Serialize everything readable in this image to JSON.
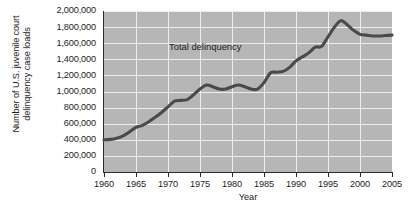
{
  "figure": {
    "background_color": "#ffffff",
    "plot_background_color": "#b6b6b6",
    "gridline_color": "#eeeeee",
    "axis_color": "#2a2a2a",
    "line_color": "#4a4a4a"
  },
  "chart_data": {
    "type": "line",
    "title": "",
    "subtitle": "",
    "xlabel": "Year",
    "ylabel": "Number of U.S. juvenile court delinquency case loads",
    "xlim": [
      1960,
      2005
    ],
    "ylim": [
      0,
      2000000
    ],
    "grid": true,
    "legend_position": "inline-annotation",
    "annotations": [
      {
        "text": "Total delinquency",
        "x": 1978,
        "y": 1520000
      }
    ],
    "xticks": [
      1960,
      1965,
      1970,
      1975,
      1980,
      1985,
      1990,
      1995,
      2000,
      2005
    ],
    "xtick_labels": [
      "1960",
      "1965",
      "1970",
      "1975",
      "1980",
      "1985",
      "1990",
      "1995",
      "2000",
      "2005"
    ],
    "yticks": [
      0,
      200000,
      400000,
      600000,
      800000,
      1000000,
      1200000,
      1400000,
      1600000,
      1800000,
      2000000
    ],
    "ytick_labels": [
      "0",
      "200,000",
      "400,000",
      "600,000",
      "800,000",
      "1,000,000",
      "1,200,000",
      "1,400,000",
      "1,600,000",
      "1,800,000",
      "2,000,000"
    ],
    "series": [
      {
        "name": "Total delinquency",
        "color": "#4a4a4a",
        "x": [
          1960,
          1961,
          1962,
          1963,
          1964,
          1965,
          1966,
          1967,
          1968,
          1969,
          1970,
          1971,
          1972,
          1973,
          1974,
          1975,
          1976,
          1977,
          1978,
          1979,
          1980,
          1981,
          1982,
          1983,
          1984,
          1985,
          1986,
          1987,
          1988,
          1989,
          1990,
          1991,
          1992,
          1993,
          1994,
          1995,
          1996,
          1997,
          1998,
          1999,
          2000,
          2001,
          2002,
          2003,
          2004,
          2005
        ],
        "values": [
          400000,
          405000,
          420000,
          450000,
          500000,
          555000,
          580000,
          625000,
          680000,
          740000,
          810000,
          880000,
          890000,
          900000,
          960000,
          1030000,
          1080000,
          1060000,
          1030000,
          1030000,
          1060000,
          1080000,
          1060000,
          1030000,
          1030000,
          1110000,
          1230000,
          1240000,
          1250000,
          1300000,
          1380000,
          1430000,
          1480000,
          1550000,
          1560000,
          1680000,
          1800000,
          1880000,
          1830000,
          1760000,
          1710000,
          1700000,
          1690000,
          1690000,
          1695000,
          1700000
        ]
      }
    ]
  }
}
